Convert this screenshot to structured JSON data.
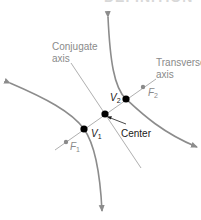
{
  "title_fragment": "DEFINITION",
  "labels": {
    "conjugate_axis_line1": "Conjugate",
    "conjugate_axis_line2": "axis",
    "transverse_axis_line1": "Transverse",
    "transverse_axis_line2": "axis",
    "v2": "V",
    "v2_sub": "2",
    "v1": "V",
    "v1_sub": "1",
    "f2": "F",
    "f2_sub": "2",
    "f1": "F",
    "f1_sub": "1",
    "center": "Center"
  },
  "colors": {
    "curve": "#8c8c8c",
    "axis_line": "#9a9a9a",
    "vertex": "#000000",
    "focus": "#8a8a8a",
    "gray_text": "#8a8a8a",
    "dark_text": "#1a1a1a"
  }
}
